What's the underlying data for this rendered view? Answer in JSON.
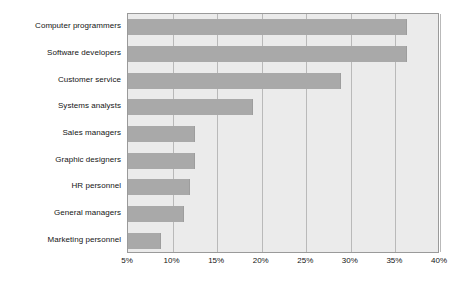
{
  "chart_data": {
    "type": "bar",
    "orientation": "horizontal",
    "title": "",
    "subtitle": "",
    "xlabel": "",
    "ylabel": "",
    "xlim": [
      5,
      40
    ],
    "ylim": null,
    "grid": true,
    "legend": null,
    "legend_position": "none",
    "tick_suffix": "%",
    "xticks": [
      5,
      10,
      15,
      20,
      25,
      30,
      35,
      40
    ],
    "xtick_labels": [
      "5%",
      "10%",
      "15%",
      "20%",
      "25%",
      "30%",
      "35%",
      "40%"
    ],
    "categories": [
      "Computer programmers",
      "Software developers",
      "Customer service",
      "Systems analysts",
      "Sales managers",
      "Graphic designers",
      "HR personnel",
      "General managers",
      "Marketing personnel"
    ],
    "values": [
      36.3,
      36.3,
      28.9,
      19.0,
      12.5,
      12.5,
      11.9,
      11.3,
      8.7
    ],
    "value_labels": [
      "36.3%",
      "36.3%",
      "28.9%",
      "19.0%",
      "12.5%",
      "12.5%",
      "11.9%",
      "11.3%",
      "8.7%"
    ],
    "colors": {
      "bar_fill": "#a9a9a9",
      "bar_edge": "#9d9d9d",
      "plot_background": "#ebebeb",
      "plot_border": "#9a9a9a",
      "gridline": "#b9b9b9",
      "page_background": "#ffffff",
      "text": "#141414"
    }
  }
}
